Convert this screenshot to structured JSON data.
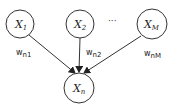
{
  "diagram": {
    "type": "bayesian-network",
    "colors": {
      "stroke": "#333333",
      "text": "#222222",
      "background": "#ffffff"
    },
    "nodes": [
      {
        "id": "x1",
        "label": "X",
        "subscript": "1",
        "cx": 20,
        "cy": 24,
        "r": 14
      },
      {
        "id": "x2",
        "label": "X",
        "subscript": "2",
        "cx": 80,
        "cy": 24,
        "r": 14
      },
      {
        "id": "xM",
        "label": "X",
        "subscript": "M",
        "cx": 152,
        "cy": 24,
        "r": 15
      },
      {
        "id": "xn",
        "label": "X",
        "subscript": "n",
        "cx": 79,
        "cy": 88,
        "r": 15
      }
    ],
    "ellipsis": "···",
    "edges": [
      {
        "from": "x1",
        "to": "xn",
        "weight": "w",
        "weight_sub": "n1"
      },
      {
        "from": "x2",
        "to": "xn",
        "weight": "w",
        "weight_sub": "n2"
      },
      {
        "from": "xM",
        "to": "xn",
        "weight": "w",
        "weight_sub": "nM"
      }
    ]
  }
}
